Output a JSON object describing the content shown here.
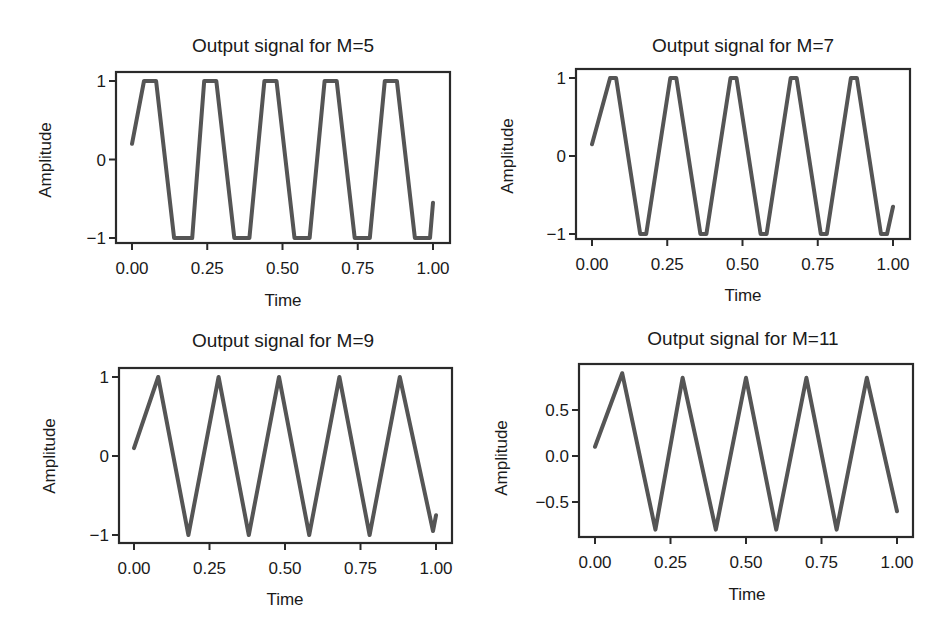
{
  "figure": {
    "line_color": "#555555",
    "frame_color": "#2a2a2a",
    "background": "#ffffff"
  },
  "chart_data": [
    {
      "type": "line",
      "title": "Output signal for M=5",
      "xlabel": "Time",
      "ylabel": "Amplitude",
      "xlim": [
        0.0,
        1.0
      ],
      "ylim": [
        -1.05,
        1.05
      ],
      "xticks": [
        "0.00",
        "0.25",
        "0.50",
        "0.75",
        "1.00"
      ],
      "yticks": [
        "1",
        "0",
        "−1"
      ],
      "ytick_values": [
        1,
        0,
        -1
      ],
      "grid": false,
      "series": [
        {
          "name": "output",
          "x": [
            0.0,
            0.04,
            0.08,
            0.14,
            0.2,
            0.24,
            0.28,
            0.34,
            0.39,
            0.44,
            0.48,
            0.54,
            0.59,
            0.64,
            0.68,
            0.74,
            0.79,
            0.84,
            0.88,
            0.94,
            0.99,
            1.0
          ],
          "y": [
            0.2,
            1.0,
            1.0,
            -1.0,
            -1.0,
            1.0,
            1.0,
            -1.0,
            -1.0,
            1.0,
            1.0,
            -1.0,
            -1.0,
            1.0,
            1.0,
            -1.0,
            -1.0,
            1.0,
            1.0,
            -1.0,
            -1.0,
            -0.55
          ]
        }
      ]
    },
    {
      "type": "line",
      "title": "Output signal for M=7",
      "xlabel": "Time",
      "ylabel": "Amplitude",
      "xlim": [
        0.0,
        1.0
      ],
      "ylim": [
        -1.05,
        1.05
      ],
      "xticks": [
        "0.00",
        "0.25",
        "0.50",
        "0.75",
        "1.00"
      ],
      "yticks": [
        "1",
        "0",
        "−1"
      ],
      "ytick_values": [
        1,
        0,
        -1
      ],
      "grid": false,
      "series": [
        {
          "name": "output",
          "x": [
            0.0,
            0.06,
            0.08,
            0.16,
            0.18,
            0.26,
            0.28,
            0.36,
            0.38,
            0.46,
            0.48,
            0.56,
            0.58,
            0.66,
            0.68,
            0.76,
            0.78,
            0.86,
            0.88,
            0.96,
            0.98,
            1.0
          ],
          "y": [
            0.15,
            1.0,
            1.0,
            -1.0,
            -1.0,
            1.0,
            1.0,
            -1.0,
            -1.0,
            1.0,
            1.0,
            -1.0,
            -1.0,
            1.0,
            1.0,
            -1.0,
            -1.0,
            1.0,
            1.0,
            -1.0,
            -1.0,
            -0.65
          ]
        }
      ]
    },
    {
      "type": "line",
      "title": "Output signal for M=9",
      "xlabel": "Time",
      "ylabel": "Amplitude",
      "xlim": [
        0.0,
        1.0
      ],
      "ylim": [
        -1.05,
        1.05
      ],
      "xticks": [
        "0.00",
        "0.25",
        "0.50",
        "0.75",
        "1.00"
      ],
      "yticks": [
        "1",
        "0",
        "−1"
      ],
      "ytick_values": [
        1,
        0,
        -1
      ],
      "grid": false,
      "series": [
        {
          "name": "output",
          "x": [
            0.0,
            0.08,
            0.18,
            0.28,
            0.38,
            0.48,
            0.58,
            0.68,
            0.78,
            0.88,
            0.99,
            1.0
          ],
          "y": [
            0.1,
            1.0,
            -1.0,
            1.0,
            -1.0,
            1.0,
            -1.0,
            1.0,
            -1.0,
            1.0,
            -0.95,
            -0.75
          ]
        }
      ]
    },
    {
      "type": "line",
      "title": "Output signal for M=11",
      "xlabel": "Time",
      "ylabel": "Amplitude",
      "xlim": [
        0.0,
        1.0
      ],
      "ylim": [
        -0.92,
        1.0
      ],
      "xticks": [
        "0.00",
        "0.25",
        "0.50",
        "0.75",
        "1.00"
      ],
      "yticks": [
        "0.5",
        "0.0",
        "−0.5"
      ],
      "ytick_values": [
        0.5,
        0.0,
        -0.5
      ],
      "grid": false,
      "series": [
        {
          "name": "output",
          "x": [
            0.0,
            0.09,
            0.2,
            0.29,
            0.4,
            0.5,
            0.6,
            0.7,
            0.8,
            0.9,
            1.0
          ],
          "y": [
            0.1,
            0.9,
            -0.8,
            0.85,
            -0.8,
            0.85,
            -0.8,
            0.85,
            -0.8,
            0.85,
            -0.6
          ]
        }
      ]
    }
  ]
}
